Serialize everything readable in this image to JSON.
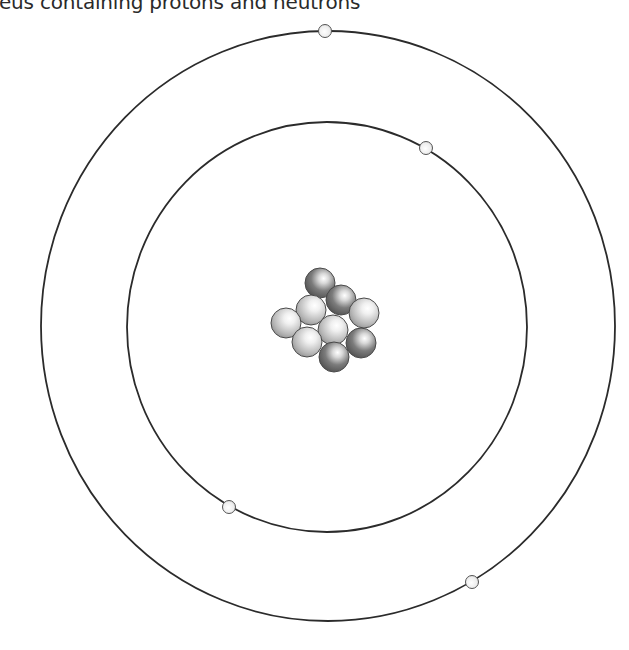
{
  "caption": "eus containing protons and neutrons",
  "diagram": {
    "type": "bohr-atom-model",
    "orbits": [
      {
        "name": "inner-orbit",
        "cx": 327,
        "cy": 327,
        "rx": 200,
        "ry": 205
      },
      {
        "name": "outer-orbit",
        "cx": 328,
        "cy": 326,
        "rx": 287,
        "ry": 295
      }
    ],
    "electrons": [
      {
        "x": 325,
        "y": 31
      },
      {
        "x": 426,
        "y": 148
      },
      {
        "x": 229,
        "y": 507
      },
      {
        "x": 472,
        "y": 582
      }
    ],
    "nucleus": {
      "particles": [
        {
          "x": 320,
          "y": 283,
          "kind": "dark"
        },
        {
          "x": 341,
          "y": 300,
          "kind": "dark"
        },
        {
          "x": 311,
          "y": 310,
          "kind": "light"
        },
        {
          "x": 364,
          "y": 313,
          "kind": "light"
        },
        {
          "x": 286,
          "y": 323,
          "kind": "light"
        },
        {
          "x": 333,
          "y": 330,
          "kind": "light"
        },
        {
          "x": 307,
          "y": 342,
          "kind": "light"
        },
        {
          "x": 361,
          "y": 343,
          "kind": "dark"
        },
        {
          "x": 334,
          "y": 357,
          "kind": "dark"
        }
      ],
      "particle_radius": 15
    },
    "colors": {
      "orbit": "#2b2b2b",
      "electron_fill": "#f2f2f2",
      "light_particle": "#c8c8c8",
      "dark_particle": "#7a7a7a"
    }
  }
}
